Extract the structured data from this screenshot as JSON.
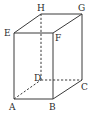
{
  "diagram": {
    "type": "cuboid",
    "colors": {
      "line": "#3a3a3a",
      "label": "#2a2a2a",
      "background": "#ffffff"
    },
    "vertices": {
      "A": {
        "label": "A",
        "x": 14,
        "y": 99
      },
      "B": {
        "label": "B",
        "x": 53,
        "y": 99
      },
      "C": {
        "label": "C",
        "x": 82,
        "y": 80
      },
      "D": {
        "label": "D",
        "x": 41,
        "y": 80
      },
      "E": {
        "label": "E",
        "x": 14,
        "y": 33
      },
      "F": {
        "label": "F",
        "x": 53,
        "y": 33
      },
      "G": {
        "label": "G",
        "x": 82,
        "y": 14
      },
      "H": {
        "label": "H",
        "x": 41,
        "y": 14
      }
    },
    "solid_edges": [
      "AB",
      "BC",
      "EF",
      "FG",
      "GH",
      "HE",
      "AE",
      "BF",
      "CG"
    ],
    "dashed_edges": [
      "AD",
      "DC",
      "DH"
    ]
  }
}
